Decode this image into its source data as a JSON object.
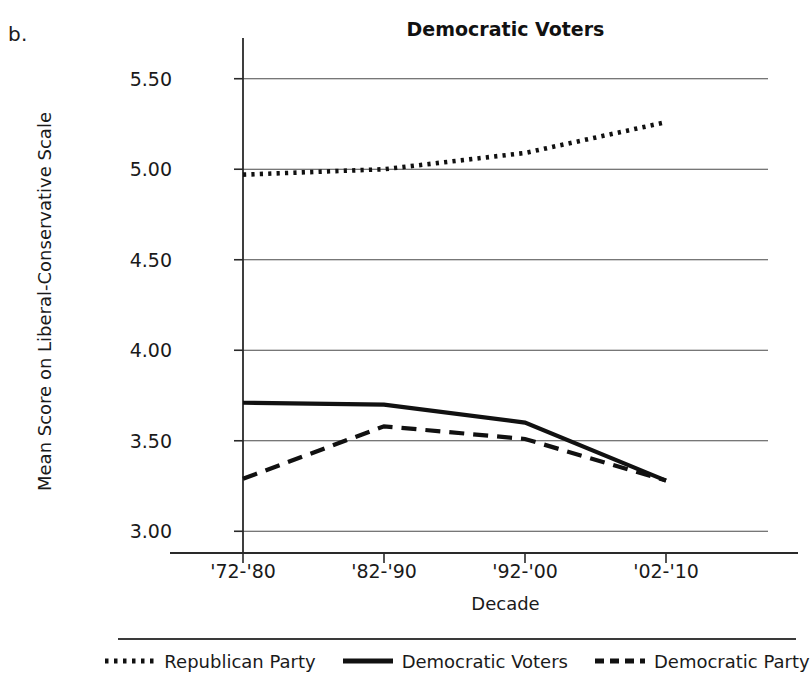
{
  "panel": {
    "label": "b."
  },
  "chart_data": {
    "type": "line",
    "title": "Democratic Voters",
    "xlabel": "Decade",
    "ylabel": "Mean Score on Liberal-Conservative Scale",
    "categories": [
      "'72-'80",
      "'82-'90",
      "'92-'00",
      "'02-'10"
    ],
    "ylim": [
      2.88,
      5.62
    ],
    "yticks": [
      3.0,
      3.5,
      4.0,
      4.5,
      5.0,
      5.5
    ],
    "ytick_labels": [
      "3.00",
      "3.50",
      "4.00",
      "4.50",
      "5.00",
      "5.50"
    ],
    "grid": "horizontal",
    "legend_position": "bottom",
    "series": [
      {
        "name": "Republican Party",
        "style": "dotted",
        "color": "#111111",
        "values": [
          4.97,
          5.0,
          5.09,
          5.26
        ]
      },
      {
        "name": "Democratic Voters",
        "style": "solid",
        "color": "#111111",
        "values": [
          3.71,
          3.7,
          3.6,
          3.28
        ]
      },
      {
        "name": "Democratic Party",
        "style": "dashed",
        "color": "#111111",
        "values": [
          3.29,
          3.58,
          3.51,
          3.28
        ]
      }
    ]
  },
  "legend": {
    "items": [
      {
        "label": "Republican Party",
        "style": "dotted"
      },
      {
        "label": "Democratic Voters",
        "style": "solid"
      },
      {
        "label": "Democratic Party",
        "style": "dashed"
      }
    ]
  }
}
